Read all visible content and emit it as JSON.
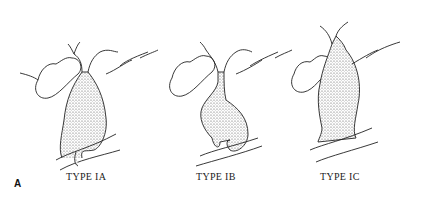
{
  "figure": {
    "panel_letter": "A",
    "diagrams": [
      {
        "label": "TYPE IA"
      },
      {
        "label": "TYPE IB"
      },
      {
        "label": "TYPE IC"
      }
    ]
  }
}
